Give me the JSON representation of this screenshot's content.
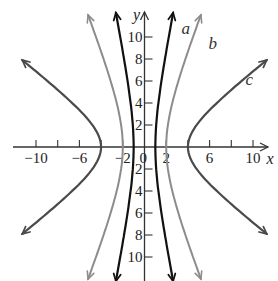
{
  "chart_data": {
    "type": "line",
    "title": "",
    "xlabel": "x",
    "ylabel": "y",
    "xlim": [
      -12.5,
      11.5
    ],
    "ylim": [
      -12,
      12
    ],
    "grid": false,
    "legend": "inline labels",
    "x_ticks": [
      -10,
      -8,
      -6,
      -4,
      -2,
      0,
      2,
      4,
      6,
      8,
      10
    ],
    "x_tick_labels": [
      {
        "value": -10,
        "label": "−10"
      },
      {
        "value": -6,
        "label": "−6"
      },
      {
        "value": -2,
        "label": "−2"
      },
      {
        "value": 0,
        "label": "0"
      },
      {
        "value": 2,
        "label": "2"
      },
      {
        "value": 6,
        "label": "6"
      },
      {
        "value": 10,
        "label": "10"
      }
    ],
    "y_ticks": [
      -10,
      -8,
      -6,
      -4,
      -2,
      2,
      4,
      6,
      8,
      10
    ],
    "y_tick_labels": [
      {
        "value": 10,
        "label": "10"
      },
      {
        "value": 8,
        "label": "8"
      },
      {
        "value": 6,
        "label": "6"
      },
      {
        "value": 4,
        "label": "4"
      },
      {
        "value": 2,
        "label": "2"
      },
      {
        "value": -2,
        "label": "2"
      },
      {
        "value": -4,
        "label": "4"
      },
      {
        "value": -6,
        "label": "6"
      },
      {
        "value": -8,
        "label": "8"
      },
      {
        "value": -10,
        "label": "10"
      }
    ],
    "series": [
      {
        "name": "a",
        "kind": "hyperbola",
        "a": 1,
        "b": 5,
        "ymax": 12.2,
        "color": "#111111",
        "width": 2.2,
        "label_pos": [
          3.4,
          10.3
        ]
      },
      {
        "name": "b",
        "kind": "hyperbola",
        "a": 2,
        "b": 5,
        "ymax": 12.0,
        "color": "#8c8c8c",
        "width": 2.0,
        "label_pos": [
          5.9,
          8.9
        ]
      },
      {
        "name": "c",
        "kind": "hyperbola",
        "a": 4,
        "b": 3,
        "ymax": 7.9,
        "color": "#4a4a4a",
        "width": 2.2,
        "label_pos": [
          9.3,
          5.6
        ]
      }
    ]
  }
}
